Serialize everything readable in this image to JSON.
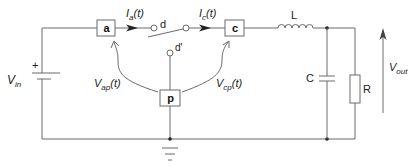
{
  "diagram": {
    "type": "circuit-schematic",
    "colors": {
      "wire": "#6a6a6a",
      "text": "#222222",
      "background": "#ffffff"
    },
    "source": {
      "label_main": "V",
      "label_sub": "in",
      "polarity": "+"
    },
    "terminals": {
      "a": {
        "label": "a"
      },
      "c": {
        "label": "c"
      },
      "p": {
        "label": "p"
      }
    },
    "currents": {
      "ia": {
        "main": "I",
        "sub": "a",
        "suffix": "(t)"
      },
      "ic": {
        "main": "I",
        "sub": "c",
        "suffix": "(t)"
      }
    },
    "voltages": {
      "vap": {
        "main": "V",
        "sub": "ap",
        "suffix": "(t)"
      },
      "vcp": {
        "main": "V",
        "sub": "cp",
        "suffix": "(t)"
      },
      "vout": {
        "main": "V",
        "sub": "out"
      }
    },
    "switch": {
      "pos_d": "d",
      "pos_dprime": "d'"
    },
    "components": {
      "inductor": "L",
      "capacitor": "C",
      "resistor": "R"
    },
    "ground": "ground"
  }
}
